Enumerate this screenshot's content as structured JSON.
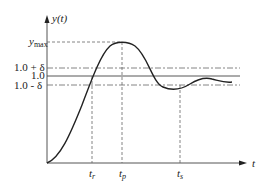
{
  "diagram": {
    "y_axis_label": "y(t)",
    "x_axis_label": "t",
    "levels": {
      "ymax": {
        "label_main": "y",
        "label_sub": "max"
      },
      "upper": "1.0 + δ",
      "final": "1.0",
      "lower": "1.0 - δ"
    },
    "times": {
      "tr": {
        "main": "t",
        "sub": "r"
      },
      "tp": {
        "main": "t",
        "sub": "p"
      },
      "ts": {
        "main": "t",
        "sub": "s"
      }
    },
    "colors": {
      "curve": "#222222",
      "axis": "#555555",
      "guide": "#666666"
    }
  }
}
